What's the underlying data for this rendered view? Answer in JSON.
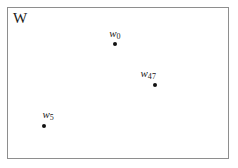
{
  "figure": {
    "width": 238,
    "height": 168,
    "background_color": "#ffffff",
    "boundary": {
      "shape": "rectangle",
      "stroke_color": "#8e8e8e",
      "fill_color": "#ffffff",
      "x": 7,
      "y": 7,
      "width": 222,
      "height": 152
    },
    "set_label": "W",
    "marker_color": "#111111",
    "text_color": "#1a1a1a"
  },
  "points": [
    {
      "id": "w0",
      "var": "w",
      "subscript": "0",
      "x": 115,
      "y": 44,
      "label_position": "above-center"
    },
    {
      "id": "w47",
      "var": "w",
      "subscript": "47",
      "x": 155,
      "y": 85,
      "label_position": "above-left"
    },
    {
      "id": "w5",
      "var": "w",
      "subscript": "5",
      "x": 44,
      "y": 126,
      "label_position": "above-right"
    }
  ]
}
